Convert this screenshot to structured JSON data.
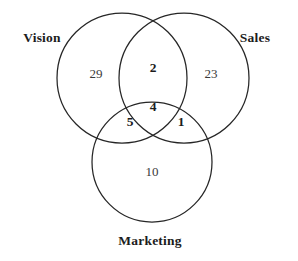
{
  "figure": {
    "type": "venn-diagram",
    "sets_count": 3,
    "background_color": "#ffffff",
    "stroke_color": "#262626",
    "text_color": "#1c1c1c"
  },
  "sets": [
    {
      "key": "vision",
      "label": "Vision",
      "label_x": 42,
      "label_y": 38,
      "circle": {
        "cx": 122,
        "cy": 78,
        "r": 65
      }
    },
    {
      "key": "sales",
      "label": "Sales",
      "label_x": 255,
      "label_y": 38,
      "circle": {
        "cx": 184,
        "cy": 78,
        "r": 65
      }
    },
    {
      "key": "marketing",
      "label": "Marketing",
      "label_x": 150,
      "label_y": 241,
      "circle": {
        "cx": 152,
        "cy": 162,
        "r": 60
      }
    }
  ],
  "regions": [
    {
      "key": "vision_only",
      "value": "29",
      "x": 96,
      "y": 73,
      "bold": false
    },
    {
      "key": "vision_sales",
      "value": "2",
      "x": 153,
      "y": 68,
      "bold": true
    },
    {
      "key": "sales_only",
      "value": "23",
      "x": 211,
      "y": 73,
      "bold": false
    },
    {
      "key": "vision_marketing",
      "value": "5",
      "x": 130,
      "y": 122,
      "bold": true
    },
    {
      "key": "vision_sales_marketing",
      "value": "4",
      "x": 153,
      "y": 107,
      "bold": true
    },
    {
      "key": "sales_marketing",
      "value": "1",
      "x": 181,
      "y": 122,
      "bold": true
    },
    {
      "key": "marketing_only",
      "value": "10",
      "x": 152,
      "y": 171,
      "bold": false
    }
  ],
  "chart_data": {
    "type": "venn",
    "title": "",
    "xlabel": "",
    "ylabel": "",
    "set_names": [
      "Vision",
      "Sales",
      "Marketing"
    ],
    "region_labels": [
      "Vision only",
      "Vision and Sales only",
      "Sales only",
      "Vision and Marketing only",
      "Vision and Sales and Marketing",
      "Sales and Marketing only",
      "Marketing only"
    ],
    "region_keys": [
      "vision_only",
      "vision_sales",
      "sales_only",
      "vision_marketing",
      "vision_sales_marketing",
      "sales_marketing",
      "marketing_only"
    ],
    "values": [
      29,
      2,
      23,
      5,
      4,
      1,
      10
    ],
    "set_totals": {
      "Vision": 40,
      "Sales": 30,
      "Marketing": 20
    },
    "total": 74,
    "grid": false,
    "legend": "none"
  }
}
